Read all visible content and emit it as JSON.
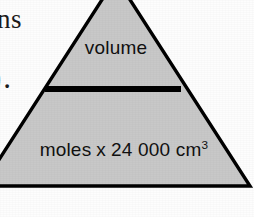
{
  "figure": {
    "kind": "formula-triangle",
    "numerator_label": "volume",
    "denominator": {
      "quantity_label": "moles",
      "operator": "x",
      "constant_value": "24 000",
      "unit_text": "cm",
      "unit_exponent": "3"
    },
    "colors": {
      "fill": "#c8c8c8",
      "outline": "#000000",
      "divider": "#000000",
      "text": "#111111",
      "background": "#fdfdfd"
    }
  },
  "page_margin_fragments": {
    "top_fragment": "ns",
    "middle_fragment": ")."
  }
}
